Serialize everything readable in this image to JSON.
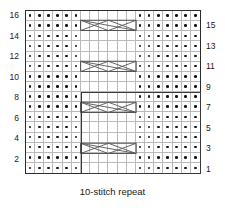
{
  "chart_data": {
    "type": "table",
    "title": "",
    "caption": "10-stitch repeat",
    "columns": 19,
    "rows": 16,
    "xlabel": "",
    "ylabel": "",
    "grid": true,
    "legend_position": "none",
    "row_labels_left": [
      "16",
      "14",
      "12",
      "10",
      "8",
      "6",
      "4",
      "2"
    ],
    "row_labels_right": [
      "15",
      "13",
      "11",
      "9",
      "7",
      "5",
      "3",
      "1"
    ],
    "left_label_rows": [
      16,
      14,
      12,
      10,
      8,
      6,
      4,
      2
    ],
    "right_label_rows": [
      15,
      13,
      11,
      9,
      7,
      5,
      3,
      1
    ],
    "symbols": {
      "purl": "dot",
      "knit": "blank",
      "cable": "6-stitch-cross"
    },
    "purl_columns": [
      1,
      2,
      3,
      4,
      5,
      6,
      13,
      14,
      15,
      16,
      17,
      18,
      19
    ],
    "blank_columns": [
      7,
      8,
      9,
      10,
      11,
      12
    ],
    "cable_rows": [
      3,
      7,
      11,
      15
    ],
    "cable_span_columns": [
      7,
      12
    ],
    "repeat_box": {
      "from_row": 1,
      "to_row": 8,
      "from_column": 7,
      "to_column": 19,
      "label": "10-stitch repeat"
    },
    "colors": {
      "grid_line": "#b9b9b9",
      "border": "#2b2b2b",
      "symbol": "#141414",
      "repeat_border": "#3a3a3a",
      "cable_line": "#555555",
      "background": "#ffffff"
    }
  }
}
